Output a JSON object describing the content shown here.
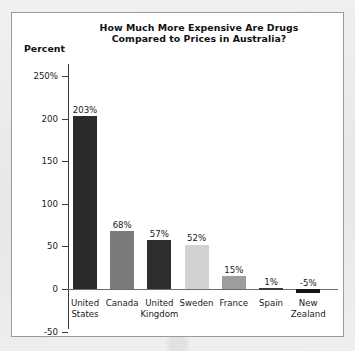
{
  "figure": {
    "axis_label": "Percent",
    "title_line1": "How Much More Expensive Are Drugs",
    "title_line2": "Compared to Prices in Australia?"
  },
  "chart_data": {
    "type": "bar",
    "title": "How Much More Expensive Are Drugs Compared to Prices in Australia?",
    "xlabel": "",
    "ylabel": "Percent",
    "ylim": [
      -50,
      250
    ],
    "yticks": [
      250,
      200,
      150,
      100,
      50,
      0,
      -50
    ],
    "ytick_labels": [
      "250%",
      "200",
      "150",
      "100",
      "50",
      "0",
      "-50"
    ],
    "grid": false,
    "legend": null,
    "categories": [
      "United States",
      "Canada",
      "United Kingdom",
      "Sweden",
      "France",
      "Spain",
      "New Zealand"
    ],
    "category_lines": [
      [
        "United",
        "States"
      ],
      [
        "Canada",
        ""
      ],
      [
        "United",
        "Kingdom"
      ],
      [
        "Sweden",
        ""
      ],
      [
        "France",
        ""
      ],
      [
        "Spain",
        ""
      ],
      [
        "New",
        "Zealand"
      ]
    ],
    "values": [
      203,
      68,
      57,
      52,
      15,
      1,
      -5
    ],
    "value_labels": [
      "203%",
      "68%",
      "57%",
      "52%",
      "15%",
      "1%",
      "-5%"
    ],
    "bar_colors": [
      "#2b2b2b",
      "#7b7b7b",
      "#2e2e2e",
      "#d2d2d2",
      "#9d9d9d",
      "#3a3a3a",
      "#151515"
    ]
  }
}
